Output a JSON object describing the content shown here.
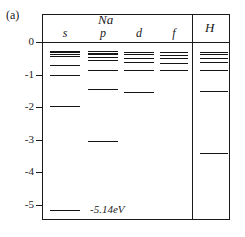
{
  "figure": {
    "panel_label": "(a)",
    "na_title": "Na",
    "h_title": "H",
    "column_labels": [
      "s",
      "p",
      "d",
      "f"
    ],
    "ground_state_note": "-5.14eV",
    "line_color": "#141414"
  },
  "axis": {
    "ticks": [
      "0",
      "-1",
      "-2",
      "-3",
      "-4",
      "-5"
    ],
    "tick_values": [
      0,
      -1,
      -2,
      -3,
      -4,
      -5
    ],
    "ylim": [
      -5.4,
      0.2
    ],
    "unit": "eV"
  },
  "chart_data": {
    "type": "line",
    "title": "Na",
    "xlabel": "",
    "ylabel": "",
    "ylim": [
      -5.4,
      0.2
    ],
    "grid": false,
    "legend": "none",
    "annotations": [
      "(a)",
      "-5.14eV"
    ],
    "columns": [
      {
        "name": "s",
        "element": "Na",
        "levels": [
          -0.28,
          -0.32,
          -0.36,
          -0.42,
          -0.7,
          -1.02,
          -1.95,
          -5.14
        ]
      },
      {
        "name": "p",
        "element": "Na",
        "levels": [
          -0.28,
          -0.33,
          -0.38,
          -0.45,
          -0.55,
          -0.85,
          -1.45,
          -3.03
        ]
      },
      {
        "name": "d",
        "element": "Na",
        "levels": [
          -0.3,
          -0.38,
          -0.48,
          -0.61,
          -0.85,
          -1.52
        ]
      },
      {
        "name": "f",
        "element": "Na",
        "levels": [
          -0.31,
          -0.39,
          -0.5,
          -0.64,
          -0.85
        ]
      },
      {
        "name": "H",
        "element": "H",
        "levels": [
          -0.3,
          -0.38,
          -0.48,
          -0.61,
          -0.85,
          -1.51,
          -3.4
        ]
      }
    ]
  }
}
